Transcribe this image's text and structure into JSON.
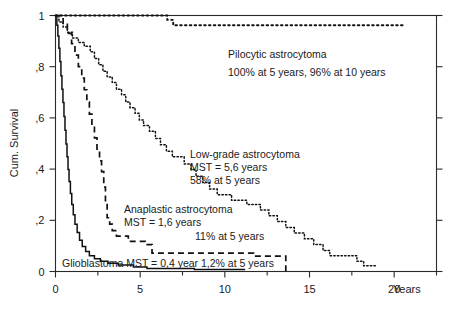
{
  "chart_data": {
    "type": "line",
    "title": "",
    "subtitle": "",
    "xlabel": "Years",
    "ylabel": "Cum. Survival",
    "xlim": [
      0,
      22.5
    ],
    "ylim": [
      0,
      1.0
    ],
    "grid": false,
    "legend_position": "inline-annotations",
    "x_ticks": [
      {
        "value": 0,
        "label": "0"
      },
      {
        "value": 5,
        "label": "5"
      },
      {
        "value": 10,
        "label": "10"
      },
      {
        "value": 15,
        "label": "15"
      },
      {
        "value": 20,
        "label": "20"
      }
    ],
    "x_minor_ticks": [
      2.5,
      7.5,
      12.5,
      17.5,
      22.5
    ],
    "y_ticks": [
      {
        "value": 1.0,
        "label": "1"
      },
      {
        "value": 0.8,
        "label": ",8"
      },
      {
        "value": 0.6,
        "label": ",6"
      },
      {
        "value": 0.4,
        "label": ",4"
      },
      {
        "value": 0.2,
        "label": ",2"
      },
      {
        "value": 0.0,
        "label": "0"
      }
    ],
    "y_right_ticks": [
      1.0,
      0.8,
      0.6,
      0.4,
      0.2,
      0.0
    ],
    "series": [
      {
        "name": "Pilocytic astrocytoma",
        "line_style": "dotted",
        "points": [
          [
            0.0,
            1.0
          ],
          [
            6.6,
            1.0
          ],
          [
            6.6,
            0.983
          ],
          [
            6.95,
            0.983
          ],
          [
            6.95,
            0.962
          ],
          [
            20.5,
            0.962
          ]
        ]
      },
      {
        "name": "Low-grade astrocytoma",
        "line_style": "fine-dotted",
        "points": [
          [
            0.0,
            1.0
          ],
          [
            0.2,
            1.0
          ],
          [
            0.2,
            0.975
          ],
          [
            0.45,
            0.975
          ],
          [
            0.45,
            0.955
          ],
          [
            0.7,
            0.955
          ],
          [
            0.7,
            0.935
          ],
          [
            1.0,
            0.935
          ],
          [
            1.0,
            0.912
          ],
          [
            1.35,
            0.912
          ],
          [
            1.35,
            0.895
          ],
          [
            1.7,
            0.895
          ],
          [
            1.7,
            0.88
          ],
          [
            2.05,
            0.88
          ],
          [
            2.05,
            0.858
          ],
          [
            2.3,
            0.858
          ],
          [
            2.3,
            0.832
          ],
          [
            2.55,
            0.832
          ],
          [
            2.55,
            0.808
          ],
          [
            2.8,
            0.808
          ],
          [
            2.8,
            0.782
          ],
          [
            3.05,
            0.782
          ],
          [
            3.05,
            0.76
          ],
          [
            3.35,
            0.76
          ],
          [
            3.35,
            0.738
          ],
          [
            3.6,
            0.738
          ],
          [
            3.6,
            0.712
          ],
          [
            3.9,
            0.712
          ],
          [
            3.9,
            0.69
          ],
          [
            4.15,
            0.69
          ],
          [
            4.15,
            0.662
          ],
          [
            4.4,
            0.662
          ],
          [
            4.4,
            0.64
          ],
          [
            4.7,
            0.64
          ],
          [
            4.7,
            0.618
          ],
          [
            4.95,
            0.618
          ],
          [
            4.95,
            0.592
          ],
          [
            5.2,
            0.592
          ],
          [
            5.2,
            0.57
          ],
          [
            5.55,
            0.57
          ],
          [
            5.55,
            0.548
          ],
          [
            5.9,
            0.548
          ],
          [
            5.9,
            0.52
          ],
          [
            6.2,
            0.52
          ],
          [
            6.2,
            0.495
          ],
          [
            6.55,
            0.495
          ],
          [
            6.55,
            0.47
          ],
          [
            6.9,
            0.47
          ],
          [
            6.9,
            0.448
          ],
          [
            7.6,
            0.448
          ],
          [
            7.6,
            0.42
          ],
          [
            8.0,
            0.42
          ],
          [
            8.0,
            0.398
          ],
          [
            8.3,
            0.398
          ],
          [
            8.3,
            0.372
          ],
          [
            8.7,
            0.372
          ],
          [
            8.7,
            0.348
          ],
          [
            9.1,
            0.348
          ],
          [
            9.1,
            0.322
          ],
          [
            9.55,
            0.322
          ],
          [
            9.55,
            0.3
          ],
          [
            10.4,
            0.3
          ],
          [
            10.4,
            0.278
          ],
          [
            11.3,
            0.278
          ],
          [
            11.3,
            0.262
          ],
          [
            12.1,
            0.262
          ],
          [
            12.1,
            0.24
          ],
          [
            12.6,
            0.24
          ],
          [
            12.6,
            0.218
          ],
          [
            13.1,
            0.218
          ],
          [
            13.1,
            0.195
          ],
          [
            13.6,
            0.195
          ],
          [
            13.6,
            0.172
          ],
          [
            14.1,
            0.172
          ],
          [
            14.1,
            0.15
          ],
          [
            14.7,
            0.15
          ],
          [
            14.7,
            0.128
          ],
          [
            15.25,
            0.128
          ],
          [
            15.25,
            0.105
          ],
          [
            15.8,
            0.105
          ],
          [
            15.8,
            0.082
          ],
          [
            16.2,
            0.082
          ],
          [
            16.2,
            0.062
          ],
          [
            17.8,
            0.062
          ],
          [
            17.8,
            0.04
          ],
          [
            18.2,
            0.04
          ],
          [
            18.2,
            0.022
          ],
          [
            18.9,
            0.022
          ]
        ]
      },
      {
        "name": "Anaplastic astrocytoma",
        "line_style": "dashed",
        "points": [
          [
            0.0,
            1.0
          ],
          [
            0.45,
            1.0
          ],
          [
            0.45,
            0.965
          ],
          [
            0.7,
            0.965
          ],
          [
            0.7,
            0.93
          ],
          [
            0.95,
            0.93
          ],
          [
            0.95,
            0.89
          ],
          [
            1.15,
            0.89
          ],
          [
            1.15,
            0.845
          ],
          [
            1.35,
            0.845
          ],
          [
            1.35,
            0.8
          ],
          [
            1.55,
            0.8
          ],
          [
            1.55,
            0.755
          ],
          [
            1.7,
            0.755
          ],
          [
            1.7,
            0.71
          ],
          [
            1.85,
            0.71
          ],
          [
            1.85,
            0.662
          ],
          [
            2.0,
            0.662
          ],
          [
            2.0,
            0.615
          ],
          [
            2.15,
            0.615
          ],
          [
            2.15,
            0.57
          ],
          [
            2.3,
            0.57
          ],
          [
            2.3,
            0.522
          ],
          [
            2.45,
            0.522
          ],
          [
            2.45,
            0.478
          ],
          [
            2.6,
            0.478
          ],
          [
            2.6,
            0.432
          ],
          [
            2.72,
            0.432
          ],
          [
            2.72,
            0.39
          ],
          [
            2.85,
            0.39
          ],
          [
            2.85,
            0.33
          ],
          [
            2.95,
            0.33
          ],
          [
            2.95,
            0.265
          ],
          [
            3.05,
            0.265
          ],
          [
            3.05,
            0.21
          ],
          [
            3.2,
            0.21
          ],
          [
            3.2,
            0.185
          ],
          [
            3.35,
            0.185
          ],
          [
            3.35,
            0.16
          ],
          [
            3.6,
            0.16
          ],
          [
            3.6,
            0.138
          ],
          [
            4.3,
            0.138
          ],
          [
            4.3,
            0.118
          ],
          [
            5.3,
            0.118
          ],
          [
            5.3,
            0.105
          ],
          [
            5.7,
            0.105
          ],
          [
            5.7,
            0.072
          ],
          [
            11.7,
            0.072
          ],
          [
            11.7,
            0.06
          ],
          [
            13.6,
            0.06
          ],
          [
            13.6,
            0.0
          ],
          [
            13.8,
            0.0
          ]
        ]
      },
      {
        "name": "Glioblastoma",
        "line_style": "solid",
        "points": [
          [
            0.0,
            1.0
          ],
          [
            0.08,
            1.0
          ],
          [
            0.08,
            0.962
          ],
          [
            0.14,
            0.962
          ],
          [
            0.14,
            0.92
          ],
          [
            0.2,
            0.92
          ],
          [
            0.2,
            0.872
          ],
          [
            0.26,
            0.872
          ],
          [
            0.26,
            0.82
          ],
          [
            0.32,
            0.82
          ],
          [
            0.32,
            0.765
          ],
          [
            0.38,
            0.765
          ],
          [
            0.38,
            0.712
          ],
          [
            0.44,
            0.712
          ],
          [
            0.44,
            0.66
          ],
          [
            0.5,
            0.66
          ],
          [
            0.5,
            0.605
          ],
          [
            0.56,
            0.605
          ],
          [
            0.56,
            0.552
          ],
          [
            0.62,
            0.552
          ],
          [
            0.62,
            0.498
          ],
          [
            0.68,
            0.498
          ],
          [
            0.68,
            0.448
          ],
          [
            0.74,
            0.448
          ],
          [
            0.74,
            0.398
          ],
          [
            0.8,
            0.398
          ],
          [
            0.8,
            0.352
          ],
          [
            0.88,
            0.352
          ],
          [
            0.88,
            0.305
          ],
          [
            0.96,
            0.305
          ],
          [
            0.96,
            0.262
          ],
          [
            1.05,
            0.262
          ],
          [
            1.05,
            0.222
          ],
          [
            1.15,
            0.222
          ],
          [
            1.15,
            0.185
          ],
          [
            1.28,
            0.185
          ],
          [
            1.28,
            0.152
          ],
          [
            1.42,
            0.152
          ],
          [
            1.42,
            0.122
          ],
          [
            1.58,
            0.122
          ],
          [
            1.58,
            0.098
          ],
          [
            1.78,
            0.098
          ],
          [
            1.78,
            0.078
          ],
          [
            2.0,
            0.078
          ],
          [
            2.0,
            0.062
          ],
          [
            2.3,
            0.062
          ],
          [
            2.3,
            0.05
          ],
          [
            2.65,
            0.05
          ],
          [
            2.65,
            0.04
          ],
          [
            3.1,
            0.04
          ],
          [
            3.1,
            0.032
          ],
          [
            3.7,
            0.032
          ],
          [
            3.7,
            0.025
          ],
          [
            4.6,
            0.025
          ],
          [
            4.6,
            0.018
          ],
          [
            5.4,
            0.018
          ],
          [
            5.4,
            0.012
          ],
          [
            8.2,
            0.012
          ],
          [
            8.2,
            0.008
          ],
          [
            11.2,
            0.008
          ]
        ]
      }
    ],
    "annotations": [
      {
        "id": "pilocytic",
        "lines": [
          "Pilocytic astrocytoma",
          "100% at 5 years, 96% at 10 years"
        ]
      },
      {
        "id": "low-grade",
        "lines": [
          "Low-grade astrocytoma",
          "MST = 5,6 years",
          "58% at 5 years"
        ]
      },
      {
        "id": "anaplastic",
        "lines": [
          "Anaplastic astrocytoma",
          "MST = 1,6 years"
        ],
        "extra_line": "11% at 5 years"
      },
      {
        "id": "glioblastoma",
        "lines": [
          "Glioblastoma MST = 0,4 year  1,2% at 5 years"
        ]
      }
    ]
  }
}
